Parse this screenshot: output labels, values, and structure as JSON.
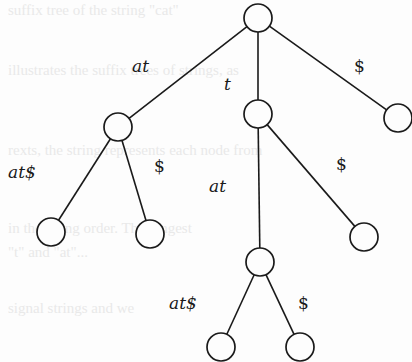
{
  "diagram": {
    "type": "suffix-tree",
    "background_ghost_text": [
      "suffix tree of the string \"cat\"",
      "",
      "illustrates the suffix trees of strings, as",
      "",
      "",
      "rexts, the string represents each node from",
      "",
      "",
      "in the string order. The longest",
      "\"t\" and \"at\"...",
      "",
      "signal strings and we"
    ],
    "nodes": [
      {
        "id": "root",
        "x": 258,
        "y": 18
      },
      {
        "id": "n_at",
        "x": 118,
        "y": 127
      },
      {
        "id": "n_t",
        "x": 258,
        "y": 114
      },
      {
        "id": "n_dollar",
        "x": 398,
        "y": 118
      },
      {
        "id": "n_at_atdollar",
        "x": 51,
        "y": 232
      },
      {
        "id": "n_at_dollar",
        "x": 150,
        "y": 234
      },
      {
        "id": "n_t_at",
        "x": 260,
        "y": 262
      },
      {
        "id": "n_t_dollar",
        "x": 364,
        "y": 237
      },
      {
        "id": "n_t_at_atdollar",
        "x": 221,
        "y": 347
      },
      {
        "id": "n_t_at_dollar",
        "x": 300,
        "y": 347
      }
    ],
    "edges": [
      {
        "from": "root",
        "to": "n_at",
        "label": "at",
        "lx": 132,
        "ly": 72
      },
      {
        "from": "root",
        "to": "n_t",
        "label": "t",
        "lx": 224,
        "ly": 90
      },
      {
        "from": "root",
        "to": "n_dollar",
        "label": "$",
        "lx": 354,
        "ly": 72
      },
      {
        "from": "n_at",
        "to": "n_at_atdollar",
        "label": "at$",
        "lx": 8,
        "ly": 178
      },
      {
        "from": "n_at",
        "to": "n_at_dollar",
        "label": "$",
        "lx": 154,
        "ly": 172
      },
      {
        "from": "n_t",
        "to": "n_t_at",
        "label": "at",
        "lx": 209,
        "ly": 192
      },
      {
        "from": "n_t",
        "to": "n_t_dollar",
        "label": "$",
        "lx": 336,
        "ly": 170
      },
      {
        "from": "n_t_at",
        "to": "n_t_at_atdollar",
        "label": "at$",
        "lx": 169,
        "ly": 309
      },
      {
        "from": "n_t_at",
        "to": "n_t_at_dollar",
        "label": "$",
        "lx": 298,
        "ly": 309
      }
    ],
    "node_radius": 14,
    "stroke_color": "#1a1a1a",
    "background_color": "#fdfdfd"
  }
}
